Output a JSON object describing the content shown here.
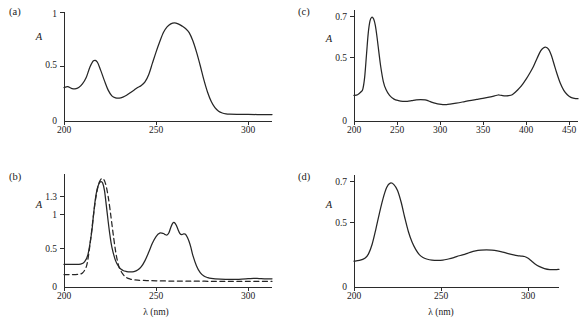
{
  "figure": {
    "background": "#ffffff",
    "line_color": "#262626",
    "panel_count": 4
  },
  "chart_data": [
    {
      "type": "line",
      "panel": "a",
      "panel_label": "(a)",
      "title": "",
      "xlabel": "",
      "ylabel": "A",
      "xlim": [
        200,
        313
      ],
      "ylim": [
        0,
        1.06
      ],
      "xticks": [
        200,
        250,
        300
      ],
      "xtick_labels": [
        "200",
        "250",
        "300"
      ],
      "yticks": [
        0,
        0.5,
        1
      ],
      "ytick_labels": [
        "0",
        "0.5",
        "1"
      ],
      "grid": false,
      "legend": "none",
      "series": [
        {
          "name": "absorbance",
          "style": "solid",
          "x": [
            200,
            202,
            204,
            206,
            208,
            210,
            212,
            214,
            216,
            218,
            220,
            222,
            224,
            226,
            228,
            230,
            232,
            234,
            236,
            238,
            240,
            242,
            244,
            246,
            248,
            250,
            252,
            254,
            256,
            258,
            260,
            262,
            264,
            266,
            268,
            270,
            272,
            274,
            276,
            278,
            280,
            282,
            284,
            286,
            288,
            290,
            295,
            300,
            305,
            310,
            313
          ],
          "y": [
            0.325,
            0.335,
            0.318,
            0.312,
            0.325,
            0.36,
            0.42,
            0.52,
            0.585,
            0.575,
            0.49,
            0.39,
            0.3,
            0.245,
            0.225,
            0.222,
            0.232,
            0.25,
            0.275,
            0.3,
            0.325,
            0.345,
            0.38,
            0.45,
            0.56,
            0.67,
            0.77,
            0.86,
            0.915,
            0.945,
            0.955,
            0.945,
            0.925,
            0.9,
            0.86,
            0.78,
            0.67,
            0.54,
            0.4,
            0.28,
            0.19,
            0.13,
            0.095,
            0.078,
            0.07,
            0.067,
            0.065,
            0.064,
            0.063,
            0.063,
            0.063
          ]
        }
      ],
      "features": {
        "peak_primary_nm": 260,
        "peak_primary_value": 0.955,
        "peak_secondary_nm": 218,
        "peak_secondary_value": 0.585,
        "shoulder_nm": 202,
        "minimum_nm": 230,
        "baseline_tail": 0.063
      }
    },
    {
      "type": "line",
      "panel": "b",
      "panel_label": "(b)",
      "title": "",
      "xlabel": "λ (nm)",
      "ylabel": "A",
      "xlim": [
        200,
        313
      ],
      "ylim": [
        0,
        1.5
      ],
      "xticks": [
        200,
        250,
        300
      ],
      "xtick_labels": [
        "200",
        "250",
        "300"
      ],
      "yticks": [
        0,
        0.5,
        1,
        1.3
      ],
      "ytick_labels": [
        "0",
        "0.5",
        "1",
        "1.3"
      ],
      "grid": false,
      "legend": "none",
      "series": [
        {
          "name": "solid-spectrum",
          "style": "solid",
          "x": [
            200,
            203,
            206,
            209,
            211,
            213,
            215,
            216,
            217,
            218,
            219,
            220,
            221,
            222,
            223,
            224,
            225,
            226,
            228,
            230,
            232,
            234,
            236,
            238,
            240,
            242,
            244,
            246,
            248,
            250,
            252,
            254,
            255,
            256,
            257,
            258,
            259,
            260,
            261,
            262,
            263,
            264,
            265,
            266,
            267,
            268,
            269,
            270,
            272,
            274,
            276,
            278,
            280,
            285,
            290,
            295,
            300,
            303,
            306,
            310,
            313
          ],
          "y": [
            0.3,
            0.3,
            0.3,
            0.305,
            0.33,
            0.43,
            0.72,
            0.95,
            1.16,
            1.3,
            1.37,
            1.4,
            1.38,
            1.28,
            1.08,
            0.87,
            0.68,
            0.53,
            0.35,
            0.26,
            0.22,
            0.205,
            0.2,
            0.205,
            0.225,
            0.27,
            0.35,
            0.46,
            0.58,
            0.67,
            0.715,
            0.71,
            0.695,
            0.69,
            0.72,
            0.79,
            0.845,
            0.855,
            0.82,
            0.76,
            0.71,
            0.695,
            0.705,
            0.7,
            0.66,
            0.6,
            0.52,
            0.42,
            0.28,
            0.19,
            0.145,
            0.125,
            0.115,
            0.105,
            0.1,
            0.102,
            0.11,
            0.115,
            0.112,
            0.108,
            0.108
          ]
        },
        {
          "name": "dashed-spectrum",
          "style": "dashed",
          "x": [
            200,
            204,
            208,
            210,
            212,
            213,
            214,
            215,
            216,
            217,
            218,
            219,
            220,
            221,
            222,
            223,
            224,
            225,
            226,
            227,
            228,
            229,
            230,
            232,
            234,
            236,
            238,
            240,
            245,
            250,
            255,
            260,
            265,
            270,
            280,
            290,
            300,
            310,
            313
          ],
          "y": [
            0.165,
            0.165,
            0.17,
            0.185,
            0.26,
            0.37,
            0.54,
            0.74,
            0.95,
            1.14,
            1.28,
            1.38,
            1.43,
            1.44,
            1.41,
            1.33,
            1.2,
            1.03,
            0.84,
            0.65,
            0.48,
            0.35,
            0.26,
            0.17,
            0.125,
            0.105,
            0.095,
            0.09,
            0.085,
            0.082,
            0.08,
            0.079,
            0.078,
            0.077,
            0.076,
            0.075,
            0.075,
            0.075,
            0.075
          ]
        }
      ],
      "features": {
        "solid_peak_nm": 220,
        "solid_peak_value": 1.4,
        "dashed_peak_nm": 221,
        "dashed_peak_value": 1.44,
        "solid_second_band_nm": 260,
        "solid_second_band_value": 0.855
      }
    },
    {
      "type": "line",
      "panel": "c",
      "panel_label": "(c)",
      "title": "",
      "xlabel": "",
      "ylabel": "A",
      "xlim": [
        200,
        452
      ],
      "ylim": [
        0,
        0.76
      ],
      "xticks": [
        200,
        250,
        300,
        350,
        400,
        450
      ],
      "xtick_labels": [
        "200",
        "250",
        "300",
        "350",
        "400",
        "450"
      ],
      "yticks": [
        0,
        0.5,
        0.7
      ],
      "ytick_labels": [
        "0",
        "0.5",
        "0.7"
      ],
      "grid": false,
      "legend": "none",
      "series": [
        {
          "name": "absorbance",
          "style": "solid",
          "x": [
            200,
            204,
            208,
            210,
            212,
            214,
            216,
            218,
            220,
            222,
            224,
            226,
            228,
            230,
            233,
            236,
            240,
            245,
            250,
            255,
            260,
            265,
            270,
            275,
            280,
            284,
            288,
            292,
            296,
            300,
            304,
            308,
            315,
            322,
            330,
            338,
            345,
            352,
            358,
            362,
            366,
            370,
            374,
            378,
            382,
            386,
            390,
            394,
            398,
            402,
            406,
            410,
            413,
            416,
            419,
            422,
            425,
            428,
            432,
            436,
            440,
            444,
            448,
            452
          ],
          "y": [
            0.175,
            0.18,
            0.2,
            0.22,
            0.3,
            0.45,
            0.6,
            0.685,
            0.71,
            0.7,
            0.655,
            0.57,
            0.47,
            0.375,
            0.27,
            0.215,
            0.175,
            0.15,
            0.14,
            0.135,
            0.135,
            0.14,
            0.145,
            0.147,
            0.145,
            0.137,
            0.127,
            0.12,
            0.115,
            0.112,
            0.112,
            0.115,
            0.122,
            0.13,
            0.14,
            0.148,
            0.155,
            0.163,
            0.172,
            0.178,
            0.175,
            0.172,
            0.173,
            0.18,
            0.2,
            0.225,
            0.255,
            0.29,
            0.33,
            0.375,
            0.43,
            0.48,
            0.5,
            0.505,
            0.49,
            0.45,
            0.39,
            0.33,
            0.26,
            0.21,
            0.18,
            0.162,
            0.155,
            0.153
          ]
        }
      ],
      "features": {
        "soret_peak_nm": 415,
        "soret_peak_value": 0.505,
        "uv_peak_nm": 220,
        "uv_peak_value": 0.71,
        "minor_band_nm": 277,
        "minor_band_nm_2": 364
      }
    },
    {
      "type": "line",
      "panel": "d",
      "panel_label": "(d)",
      "title": "",
      "xlabel": "λ (nm)",
      "ylabel": "A",
      "xlim": [
        200,
        313
      ],
      "ylim": [
        0,
        0.76
      ],
      "xticks": [
        200,
        250,
        300
      ],
      "xtick_labels": [
        "200",
        "250",
        "300"
      ],
      "yticks": [
        0,
        0.5,
        0.7
      ],
      "ytick_labels": [
        "0",
        "0.5",
        "0.7"
      ],
      "grid": false,
      "legend": "none",
      "series": [
        {
          "name": "absorbance",
          "style": "solid",
          "x": [
            200,
            203,
            206,
            208,
            210,
            212,
            214,
            216,
            218,
            220,
            222,
            224,
            226,
            228,
            230,
            232,
            234,
            236,
            238,
            240,
            243,
            246,
            249,
            252,
            255,
            258,
            261,
            264,
            267,
            270,
            273,
            276,
            279,
            282,
            285,
            288,
            290,
            292,
            294,
            296,
            298,
            300,
            302,
            305,
            308,
            311,
            313
          ],
          "y": [
            0.175,
            0.18,
            0.195,
            0.225,
            0.29,
            0.39,
            0.5,
            0.6,
            0.675,
            0.705,
            0.695,
            0.655,
            0.575,
            0.47,
            0.375,
            0.305,
            0.255,
            0.22,
            0.2,
            0.19,
            0.182,
            0.18,
            0.182,
            0.19,
            0.2,
            0.212,
            0.222,
            0.235,
            0.245,
            0.25,
            0.252,
            0.25,
            0.245,
            0.237,
            0.227,
            0.218,
            0.213,
            0.21,
            0.207,
            0.195,
            0.175,
            0.155,
            0.14,
            0.125,
            0.118,
            0.118,
            0.12
          ]
        }
      ],
      "features": {
        "peak_nm": 220,
        "peak_value": 0.705,
        "shoulder_nm": 274,
        "shoulder_value": 0.252,
        "minimum_nm": 246
      }
    }
  ]
}
